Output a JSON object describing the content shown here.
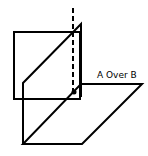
{
  "diagram": {
    "title": "",
    "label": "A Over B",
    "stroke_color": "#000000",
    "background": "#ffffff",
    "elements": {
      "square": "rectangle plane A (front, upright square)",
      "vertical_plane": "vertical slanted plane",
      "horizontal_plane": "horizontal parallelogram plane B",
      "axis": "dashed vertical axis line"
    }
  }
}
